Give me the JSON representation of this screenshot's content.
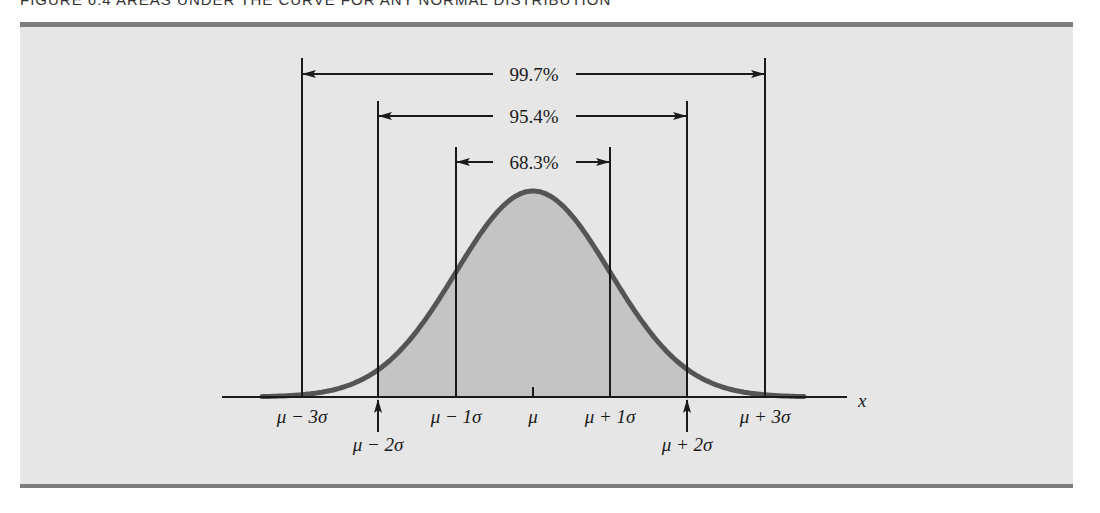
{
  "figure": {
    "title": "FIGURE 6.4   AREAS UNDER THE CURVE FOR ANY NORMAL DISTRIBUTION"
  },
  "colors": {
    "panel_bg": "#e6e6e6",
    "rule": "#7d7d7d",
    "curve": "#555555",
    "fill": "#c4c4c4",
    "ink": "#1a1a1a"
  },
  "chart_data": {
    "type": "area",
    "title": "Areas under the curve for any normal distribution",
    "xlabel": "x",
    "ylabel": "",
    "distribution": "normal",
    "mean_label": "μ",
    "x_ticks": [
      {
        "pos": -3,
        "label": "μ − 3σ",
        "marker": "line"
      },
      {
        "pos": -2,
        "label": "μ − 2σ",
        "marker": "arrow"
      },
      {
        "pos": -1,
        "label": "μ − 1σ",
        "marker": "line"
      },
      {
        "pos": 0,
        "label": "μ",
        "marker": "tick"
      },
      {
        "pos": 1,
        "label": "μ + 1σ",
        "marker": "line"
      },
      {
        "pos": 2,
        "label": "μ + 2σ",
        "marker": "arrow"
      },
      {
        "pos": 3,
        "label": "μ + 3σ",
        "marker": "line"
      }
    ],
    "intervals": [
      {
        "from": -3,
        "to": 3,
        "label": "99.7%",
        "value": 99.7
      },
      {
        "from": -2,
        "to": 2,
        "label": "95.4%",
        "value": 95.4
      },
      {
        "from": -1,
        "to": 1,
        "label": "68.3%",
        "value": 68.3
      }
    ],
    "shaded_region": [
      -2,
      2
    ],
    "grid": false,
    "legend": "none"
  },
  "labels": {
    "p997": "99.7%",
    "p954": "95.4%",
    "p683": "68.3%",
    "m3": "μ − 3σ",
    "m2": "μ − 2σ",
    "m1": "μ − 1σ",
    "mu": "μ",
    "p1": "μ + 1σ",
    "p2": "μ + 2σ",
    "p3": "μ + 3σ",
    "x": "x"
  }
}
